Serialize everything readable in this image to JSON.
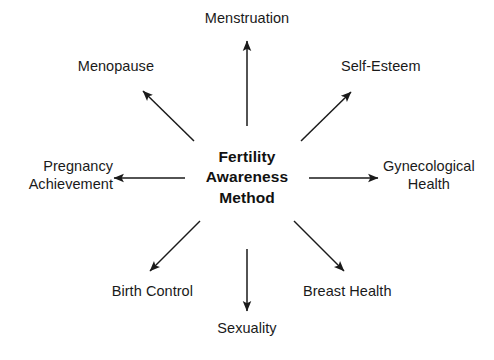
{
  "diagram": {
    "type": "radial-hub-and-spoke",
    "title": "Fertility Awareness Method",
    "background_color": "#ffffff",
    "text_color": "#1a1a1a",
    "arrow_color": "#1a1a1a",
    "center": {
      "label": "Fertility Awareness Method",
      "lines": [
        "Fertility",
        "Awareness",
        "Method"
      ],
      "emphasis": "bold"
    },
    "spoke_count": 8,
    "nodes": [
      {
        "id": "menstruation",
        "label": "Menstruation",
        "lines": [
          "Menstruation"
        ],
        "direction": "north",
        "arrow": "outward"
      },
      {
        "id": "self-esteem",
        "label": "Self-Esteem",
        "lines": [
          "Self-Esteem"
        ],
        "direction": "northeast",
        "arrow": "outward"
      },
      {
        "id": "gynecological-health",
        "label": "Gynecological Health",
        "lines": [
          "Gynecological",
          "Health"
        ],
        "direction": "east",
        "arrow": "outward"
      },
      {
        "id": "breast-health",
        "label": "Breast Health",
        "lines": [
          "Breast Health"
        ],
        "direction": "southeast",
        "arrow": "outward"
      },
      {
        "id": "sexuality",
        "label": "Sexuality",
        "lines": [
          "Sexuality"
        ],
        "direction": "south",
        "arrow": "outward"
      },
      {
        "id": "birth-control",
        "label": "Birth Control",
        "lines": [
          "Birth Control"
        ],
        "direction": "southwest",
        "arrow": "outward"
      },
      {
        "id": "pregnancy-achievement",
        "label": "Pregnancy Achievement",
        "lines": [
          "Pregnancy",
          "Achievement"
        ],
        "direction": "west",
        "arrow": "outward"
      },
      {
        "id": "menopause",
        "label": "Menopause",
        "lines": [
          "Menopause"
        ],
        "direction": "northwest",
        "arrow": "outward"
      }
    ]
  }
}
